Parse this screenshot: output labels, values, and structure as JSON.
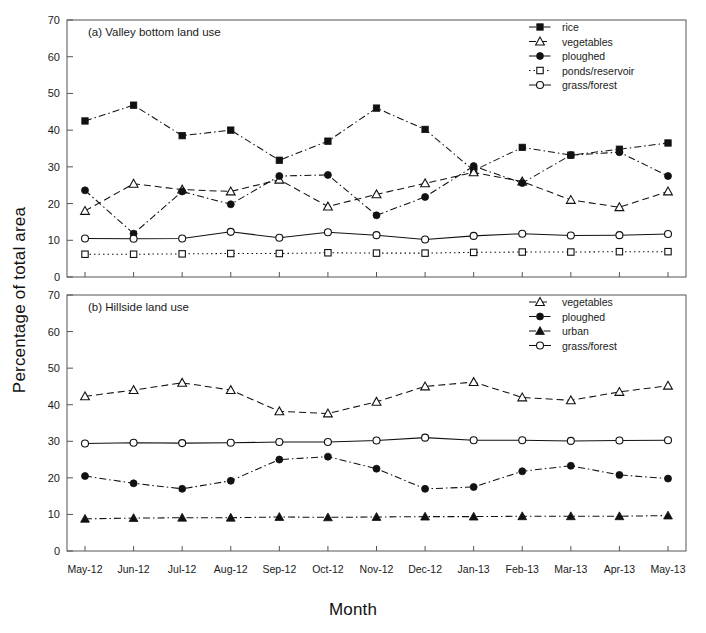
{
  "figure": {
    "xlabel": "Month",
    "ylabel": "Percentage of total area"
  },
  "chart_data": [
    {
      "type": "line",
      "title": "(a) Valley bottom land use",
      "xlabel": "Month",
      "ylabel": "Percentage of total area",
      "ylim": [
        0,
        70
      ],
      "yticks": [
        0,
        10,
        20,
        30,
        40,
        50,
        60,
        70
      ],
      "grid": false,
      "legend_position": "top-right",
      "categories": [
        "May-12",
        "Jun-12",
        "Jul-12",
        "Aug-12",
        "Sep-12",
        "Oct-12",
        "Nov-12",
        "Dec-12",
        "Jan-13",
        "Feb-13",
        "Mar-13",
        "Apr-13",
        "May-13"
      ],
      "series": [
        {
          "name": "rice",
          "marker": "filled-square",
          "linestyle": "dashdot",
          "values": [
            42.5,
            46.8,
            38.5,
            40.0,
            31.8,
            37.0,
            46.0,
            40.2,
            29.0,
            35.3,
            33.2,
            34.8,
            36.5
          ]
        },
        {
          "name": "vegetables",
          "marker": "open-triangle",
          "linestyle": "dashed",
          "values": [
            18.0,
            25.4,
            23.8,
            23.3,
            26.5,
            19.2,
            22.5,
            25.5,
            28.5,
            26.0,
            21.0,
            19.0,
            23.3
          ]
        },
        {
          "name": "ploughed",
          "marker": "filled-circle",
          "linestyle": "dashdot",
          "values": [
            23.6,
            11.8,
            23.3,
            19.8,
            27.5,
            27.8,
            16.8,
            21.8,
            30.2,
            25.6,
            33.2,
            34.0,
            27.5
          ]
        },
        {
          "name": "ponds/reservoir",
          "marker": "open-square",
          "linestyle": "dotted",
          "values": [
            6.2,
            6.2,
            6.3,
            6.4,
            6.4,
            6.6,
            6.5,
            6.5,
            6.7,
            6.8,
            6.8,
            6.9,
            6.9
          ]
        },
        {
          "name": "grass/forest",
          "marker": "open-circle",
          "linestyle": "solid",
          "values": [
            10.5,
            10.4,
            10.5,
            12.3,
            10.7,
            12.2,
            11.4,
            10.2,
            11.2,
            11.8,
            11.3,
            11.4,
            11.7
          ]
        }
      ]
    },
    {
      "type": "line",
      "title": "(b) Hillside land use",
      "xlabel": "Month",
      "ylabel": "Percentage of total area",
      "ylim": [
        0,
        70
      ],
      "yticks": [
        0,
        10,
        20,
        30,
        40,
        50,
        60,
        70
      ],
      "grid": false,
      "legend_position": "top-right",
      "categories": [
        "May-12",
        "Jun-12",
        "Jul-12",
        "Aug-12",
        "Sep-12",
        "Oct-12",
        "Nov-12",
        "Dec-12",
        "Jan-13",
        "Feb-13",
        "Mar-13",
        "Apr-13",
        "May-13"
      ],
      "series": [
        {
          "name": "vegetables",
          "marker": "open-triangle",
          "linestyle": "dashed",
          "values": [
            42.3,
            44.0,
            46.0,
            44.0,
            38.2,
            37.6,
            40.8,
            45.0,
            46.2,
            42.0,
            41.2,
            43.5,
            45.2
          ]
        },
        {
          "name": "ploughed",
          "marker": "filled-circle",
          "linestyle": "dashdot",
          "values": [
            20.5,
            18.5,
            17.0,
            19.2,
            25.0,
            25.8,
            22.5,
            17.0,
            17.5,
            21.8,
            23.3,
            20.8,
            19.8
          ]
        },
        {
          "name": "urban",
          "marker": "filled-triangle",
          "linestyle": "dashdot",
          "values": [
            8.8,
            9.0,
            9.1,
            9.1,
            9.3,
            9.2,
            9.3,
            9.4,
            9.4,
            9.5,
            9.5,
            9.5,
            9.7
          ]
        },
        {
          "name": "grass/forest",
          "marker": "open-circle",
          "linestyle": "solid",
          "values": [
            29.4,
            29.6,
            29.5,
            29.6,
            29.8,
            29.8,
            30.2,
            31.0,
            30.3,
            30.3,
            30.1,
            30.2,
            30.3
          ]
        }
      ]
    }
  ]
}
